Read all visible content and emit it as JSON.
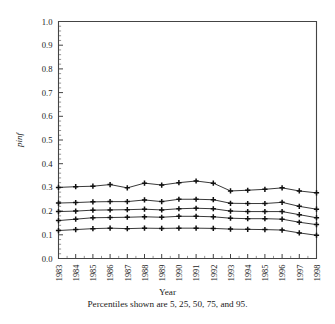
{
  "chart_data": {
    "type": "line",
    "title": "",
    "xlabel": "Year",
    "ylabel": "pinf",
    "caption": "Percentiles shown are 5, 25, 50, 75, and 95.",
    "categories": [
      "1983",
      "1984",
      "1985",
      "1986",
      "1987",
      "1988",
      "1989",
      "1990",
      "1991",
      "1992",
      "1993",
      "1994",
      "1985",
      "1996",
      "1997",
      "1998"
    ],
    "x": [
      1983,
      1984,
      1985,
      1986,
      1987,
      1988,
      1989,
      1990,
      1991,
      1992,
      1993,
      1994,
      1995,
      1996,
      1997,
      1998
    ],
    "ylim": [
      0.0,
      1.0
    ],
    "ytick_labels": [
      "0.0",
      "0.1",
      "0.2",
      "0.3",
      "0.4",
      "0.5",
      "0.6",
      "0.7",
      "0.8",
      "0.9",
      "1.0"
    ],
    "ytick_values": [
      0.0,
      0.1,
      0.2,
      0.3,
      0.4,
      0.5,
      0.6,
      0.7,
      0.8,
      0.9,
      1.0
    ],
    "yminor_step": 0.02,
    "grid": false,
    "legend_position": "none",
    "marker": "plus",
    "series": [
      {
        "name": "95th percentile",
        "percentile": 95,
        "values": [
          0.3,
          0.303,
          0.305,
          0.312,
          0.298,
          0.318,
          0.31,
          0.32,
          0.327,
          0.318,
          0.285,
          0.288,
          0.292,
          0.298,
          0.285,
          0.277
        ]
      },
      {
        "name": "75th percentile",
        "percentile": 75,
        "values": [
          0.234,
          0.236,
          0.239,
          0.24,
          0.24,
          0.247,
          0.24,
          0.25,
          0.25,
          0.248,
          0.233,
          0.232,
          0.232,
          0.237,
          0.22,
          0.208
        ]
      },
      {
        "name": "50th percentile",
        "percentile": 50,
        "values": [
          0.198,
          0.2,
          0.204,
          0.205,
          0.206,
          0.208,
          0.205,
          0.21,
          0.212,
          0.21,
          0.2,
          0.198,
          0.198,
          0.198,
          0.185,
          0.172
        ]
      },
      {
        "name": "25th percentile",
        "percentile": 25,
        "values": [
          0.16,
          0.166,
          0.172,
          0.173,
          0.174,
          0.176,
          0.174,
          0.178,
          0.178,
          0.176,
          0.17,
          0.168,
          0.168,
          0.166,
          0.153,
          0.143
        ]
      },
      {
        "name": "5th percentile",
        "percentile": 5,
        "values": [
          0.118,
          0.122,
          0.126,
          0.128,
          0.126,
          0.128,
          0.127,
          0.128,
          0.128,
          0.127,
          0.124,
          0.123,
          0.122,
          0.12,
          0.108,
          0.098
        ]
      }
    ]
  }
}
